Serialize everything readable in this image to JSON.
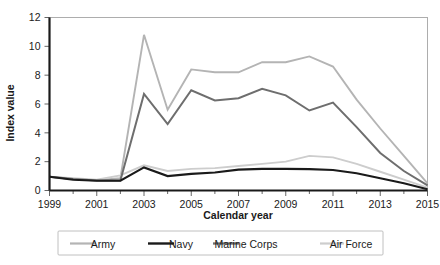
{
  "chart_data": {
    "type": "line",
    "title": "",
    "xlabel": "Calendar year",
    "ylabel": "Index value",
    "xlim": [
      1999,
      2015
    ],
    "ylim": [
      0,
      12
    ],
    "ytick_values": [
      0,
      2,
      4,
      6,
      8,
      10,
      12
    ],
    "ytick_labels": [
      "0",
      "2",
      "4",
      "6",
      "8",
      "10",
      "12"
    ],
    "xtick_values": [
      1999,
      2001,
      2003,
      2005,
      2007,
      2009,
      2011,
      2013,
      2015
    ],
    "xtick_labels": [
      "1999",
      "2001",
      "2003",
      "2005",
      "2007",
      "2009",
      "2011",
      "2013",
      "2015"
    ],
    "x_minor_ticks": [
      2000,
      2002,
      2004,
      2006,
      2008,
      2010,
      2012,
      2014
    ],
    "grid": false,
    "legend_position": "bottom",
    "x": [
      1999,
      2000,
      2001,
      2002,
      2003,
      2004,
      2005,
      2006,
      2007,
      2008,
      2009,
      2010,
      2011,
      2012,
      2013,
      2014,
      2015
    ],
    "series": [
      {
        "name": "Army",
        "color": "#b4b4b4",
        "width": 1.9,
        "values": [
          0.95,
          0.8,
          0.72,
          0.85,
          10.8,
          5.6,
          8.4,
          8.2,
          8.2,
          8.9,
          8.9,
          9.3,
          8.6,
          6.3,
          4.3,
          2.4,
          0.5
        ]
      },
      {
        "name": "Navy",
        "color": "#1a1a1a",
        "width": 2.1,
        "values": [
          0.95,
          0.75,
          0.68,
          0.68,
          1.6,
          1.0,
          1.15,
          1.25,
          1.45,
          1.5,
          1.5,
          1.48,
          1.42,
          1.2,
          0.85,
          0.5,
          0.08
        ]
      },
      {
        "name": "Marine Corps",
        "color": "#6e6e6e",
        "width": 2.0,
        "values": [
          0.95,
          0.8,
          0.7,
          0.7,
          6.7,
          4.6,
          6.95,
          6.25,
          6.4,
          7.05,
          6.6,
          5.55,
          6.1,
          4.4,
          2.6,
          1.35,
          0.35
        ]
      },
      {
        "name": "Air Force",
        "color": "#cdcdcd",
        "width": 1.9,
        "values": [
          0.95,
          0.85,
          0.75,
          1.05,
          1.75,
          1.35,
          1.5,
          1.55,
          1.7,
          1.85,
          2.0,
          2.4,
          2.3,
          1.85,
          1.3,
          0.75,
          0.2
        ]
      }
    ]
  },
  "legend": {
    "entries": [
      {
        "label": "Army"
      },
      {
        "label": "Navy"
      },
      {
        "label": "Marine Corps"
      },
      {
        "label": "Air Force"
      }
    ]
  }
}
